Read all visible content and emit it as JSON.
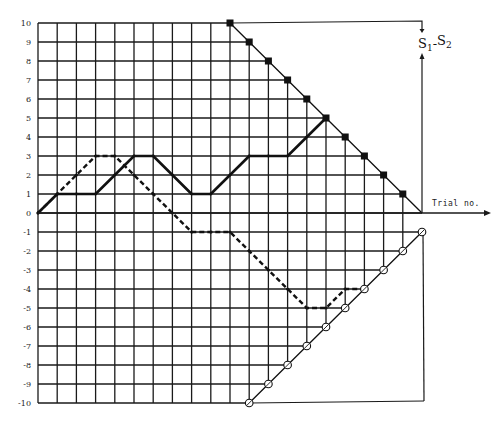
{
  "chart_data": {
    "type": "line",
    "title": "",
    "xlabel": "Trial no.",
    "ylabel": "S1-S2",
    "ylabel_parts": {
      "main1": "S",
      "sub1": "1",
      "sep": "-",
      "main2": "S",
      "sub2": "2"
    },
    "xlim": [
      0,
      20
    ],
    "ylim": [
      -10,
      10
    ],
    "yticks": [
      10,
      9,
      8,
      7,
      6,
      5,
      4,
      3,
      2,
      1,
      0,
      -1,
      -2,
      -3,
      -4,
      -5,
      -6,
      -7,
      -8,
      -9,
      -10
    ],
    "grid": true,
    "series": [
      {
        "name": "solid-path",
        "style": "solid",
        "x": [
          0,
          1,
          2,
          3,
          4,
          5,
          6,
          7,
          8,
          9,
          10,
          11,
          12,
          13,
          14,
          15
        ],
        "y": [
          0,
          1,
          1,
          1,
          2,
          3,
          3,
          2,
          1,
          1,
          2,
          3,
          3,
          3,
          4,
          5
        ]
      },
      {
        "name": "dashed-path",
        "style": "dashed",
        "x": [
          0,
          1,
          2,
          3,
          4,
          5,
          6,
          7,
          8,
          9,
          10,
          11,
          12,
          13,
          14,
          15,
          16,
          17
        ],
        "y": [
          0,
          1,
          2,
          3,
          3,
          2,
          1,
          0,
          -1,
          -1,
          -1,
          -2,
          -3,
          -4,
          -5,
          -5,
          -4,
          -4
        ]
      },
      {
        "name": "upper-boundary",
        "style": "boundary-square",
        "x": [
          10,
          11,
          12,
          13,
          14,
          15,
          16,
          17,
          18,
          19,
          20
        ],
        "y": [
          10,
          9,
          8,
          7,
          6,
          5,
          4,
          3,
          2,
          1,
          0
        ]
      },
      {
        "name": "lower-boundary",
        "style": "boundary-circle",
        "x": [
          11,
          12,
          13,
          14,
          15,
          16,
          17,
          18,
          19,
          20
        ],
        "y": [
          -10,
          -9,
          -8,
          -7,
          -6,
          -5,
          -4,
          -3,
          -2,
          -1
        ]
      }
    ],
    "annotations": [
      {
        "text": "S1-S2",
        "position": "top-right, y-axis label"
      },
      {
        "text": "Trial no.",
        "position": "right end of x-axis"
      }
    ]
  }
}
